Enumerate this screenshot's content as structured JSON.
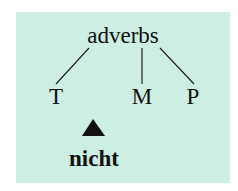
{
  "diagram": {
    "root": {
      "label": "adverbs"
    },
    "children": [
      {
        "label": "T"
      },
      {
        "label": "M"
      },
      {
        "label": "P"
      }
    ],
    "marker": {
      "symbol": "up-triangle",
      "label": "nicht"
    },
    "colors": {
      "panel": "#cdeee2",
      "ink": "#111111"
    }
  }
}
